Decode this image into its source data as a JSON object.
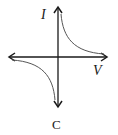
{
  "diagram": {
    "axis_y_label": "I",
    "axis_x_label": "V",
    "caption": "C",
    "curve": "hyperbola in quadrants I and III (I ∝ 1/V)",
    "colors": {
      "axis": "#1a1a1a",
      "curve": "#555555"
    }
  }
}
